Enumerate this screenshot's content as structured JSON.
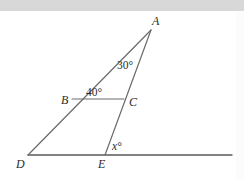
{
  "figure": {
    "kind": "geometry-diagram",
    "background_color": "#ffffff",
    "top_band_color": "#d8d8d8",
    "stroke_color": "#595959",
    "text_color": "#2b2b2b",
    "vertices": [
      {
        "name": "A",
        "label": "A",
        "x": 151,
        "y": 30,
        "label_x": 152,
        "label_y": 25
      },
      {
        "name": "B",
        "label": "B",
        "x": 72,
        "y": 99,
        "label_x": 63,
        "label_y": 103
      },
      {
        "name": "C",
        "label": "C",
        "x": 124,
        "y": 99,
        "label_x": 130,
        "label_y": 105
      },
      {
        "name": "D",
        "label": "D",
        "x": 28,
        "y": 155,
        "label_x": 18,
        "label_y": 167
      },
      {
        "name": "E",
        "label": "E",
        "x": 105,
        "y": 155,
        "label_x": 99,
        "label_y": 167
      }
    ],
    "segments": [
      {
        "name": "segment-AD",
        "from": "A",
        "to": "D"
      },
      {
        "name": "segment-AE",
        "from": "A",
        "to": "E"
      },
      {
        "name": "segment-BC",
        "from": "B",
        "to": "C"
      },
      {
        "name": "baseline-DF",
        "from": "D",
        "to": "F"
      }
    ],
    "baseline": {
      "x1": 28,
      "y1": 155,
      "x2": 232,
      "y2": 155
    },
    "angles": [
      {
        "name": "angle-at-A",
        "label": "30°",
        "value": 30,
        "at_vertex": "A",
        "label_x": 118,
        "label_y": 68
      },
      {
        "name": "angle-at-B",
        "label": "40°",
        "value": 40,
        "at_vertex": "B",
        "label_x": 86,
        "label_y": 96
      },
      {
        "name": "angle-at-E",
        "label": "x°",
        "value": null,
        "at_vertex": "E",
        "label_x": 112,
        "label_y": 150
      }
    ]
  }
}
